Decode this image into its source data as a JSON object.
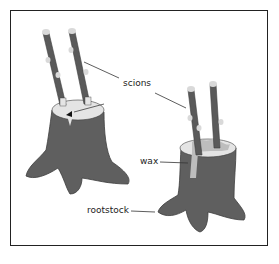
{
  "figure": {
    "labels": {
      "scions": "scions",
      "wax": "wax",
      "rootstock": "rootstock"
    },
    "colors": {
      "bark": "#5f5f5f",
      "bark_dark": "#3e3e3e",
      "cut_surface": "#e4e4e4",
      "bud": "#d9d9d9",
      "wax": "#bdbdbd",
      "frame": "#222222",
      "leader": "#333333"
    }
  }
}
